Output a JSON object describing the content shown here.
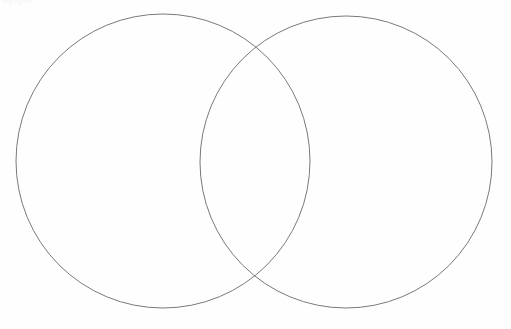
{
  "page": {
    "width": 511,
    "height": 329,
    "background_color": "#fefefe"
  },
  "caption": {
    "top_text": "ing figure"
  },
  "style": {
    "stroke_color": "#7a7a7a",
    "stroke_width": 1,
    "fill_color": "none",
    "footer_rule_color": "#fcfcfc"
  },
  "chart_data": {
    "type": "diagram",
    "diagram_type": "venn",
    "title": "",
    "set_count": 2,
    "filled": false,
    "labels_present": false,
    "circles": [
      {
        "id": "left-circle",
        "label": "",
        "cx": 163,
        "cy": 161,
        "r": 147,
        "stroke": "#7a7a7a",
        "fill": "none"
      },
      {
        "id": "right-circle",
        "label": "",
        "cx": 346,
        "cy": 162,
        "r": 146,
        "stroke": "#7a7a7a",
        "fill": "none"
      }
    ],
    "regions": [
      {
        "id": "left-only",
        "label": "",
        "value": ""
      },
      {
        "id": "intersection",
        "label": "",
        "value": ""
      },
      {
        "id": "right-only",
        "label": "",
        "value": ""
      }
    ],
    "intersection_points": [
      {
        "x": 258,
        "y": 53
      },
      {
        "x": 258,
        "y": 272
      }
    ]
  }
}
